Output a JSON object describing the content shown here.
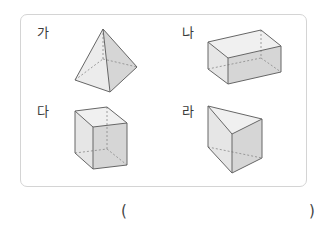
{
  "figure": {
    "items": [
      {
        "label": "가",
        "shape": "square-pyramid"
      },
      {
        "label": "나",
        "shape": "rectangular-cuboid"
      },
      {
        "label": "다",
        "shape": "cube"
      },
      {
        "label": "라",
        "shape": "triangular-prism"
      }
    ],
    "colors": {
      "border": "#d4d4d4",
      "edge": "#666666",
      "face_light": "#ececec",
      "face_mid": "#e2e2e2",
      "face_dark": "#d2d2d2"
    }
  },
  "answer": {
    "open_paren": "(",
    "close_paren": ")",
    "value": ""
  }
}
